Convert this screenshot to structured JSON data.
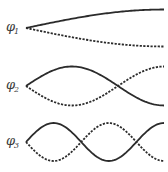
{
  "diagram": {
    "title": "",
    "line_color": "#2b2b2b",
    "x_start": 26,
    "x_end": 164,
    "modes": [
      {
        "id": "phi-1",
        "symbol": "φ",
        "subscript": "1",
        "center_y": 28,
        "amplitude": 18.5,
        "half_waves": 1,
        "label_x": 6,
        "label_y": 20
      },
      {
        "id": "phi-2",
        "symbol": "φ",
        "subscript": "2",
        "center_y": 86,
        "amplitude": 19.5,
        "half_waves": 3,
        "label_x": 6,
        "label_y": 78
      },
      {
        "id": "phi-3",
        "symbol": "φ",
        "subscript": "3",
        "center_y": 142,
        "amplitude": 19,
        "half_waves": 5,
        "label_x": 6,
        "label_y": 134
      }
    ]
  }
}
